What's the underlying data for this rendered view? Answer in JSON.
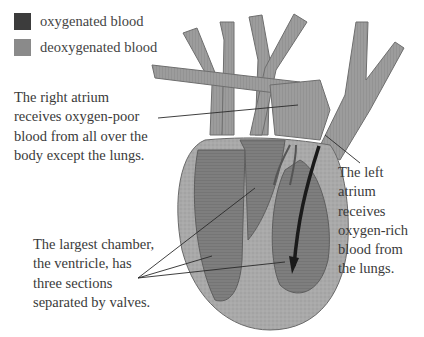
{
  "legend": {
    "items": [
      {
        "label": "oxygenated blood",
        "color": "#3c3c3c"
      },
      {
        "label": "deoxygenated blood",
        "color": "#8a8a8a"
      }
    ]
  },
  "labels": {
    "right_atrium": "The right atrium\nreceives oxygen-poor\nblood from all over the\nbody except the lungs.",
    "ventricle": "The largest chamber,\nthe ventricle, has\nthree sections\nseparated by valves.",
    "left_atrium": "The left\natrium\nreceives\noxygen-rich\nblood from\nthe lungs."
  },
  "colors": {
    "heart_outer": "#a8a8a8",
    "chamber": "#7d7d7d",
    "vessel": "#9a9a9a",
    "arrow": "#1a1a1a"
  }
}
